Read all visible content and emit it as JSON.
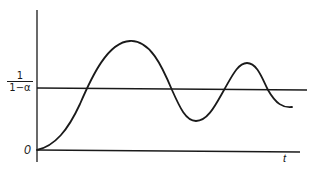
{
  "diagram": {
    "type": "damped-oscillation-response",
    "y_axis": {
      "label_numerator": "1",
      "label_denominator": "1−α"
    },
    "x_axis": {
      "label": "t"
    },
    "origin_label": "0",
    "reference_line": {
      "description": "steady-state level 1/(1-α)"
    },
    "curve": {
      "description": "starts at origin, rises above reference, oscillates with decaying amplitude around 1/(1-α)"
    },
    "colors": {
      "stroke": "#1a1a1a",
      "background": "#ffffff"
    }
  }
}
